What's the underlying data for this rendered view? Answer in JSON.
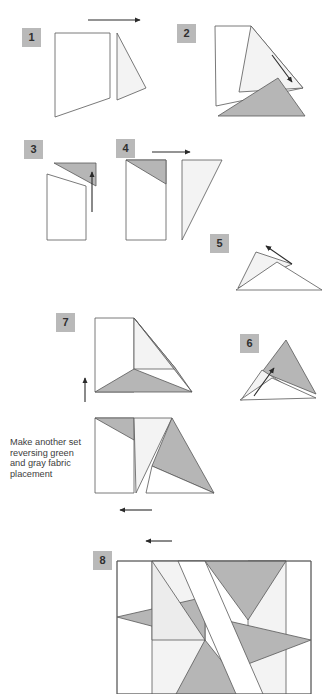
{
  "document": {
    "title": "Quilt Block Assembly Diagram",
    "type": "step-by-step sewing instruction illustration",
    "background_color": "#ffffff"
  },
  "palette": {
    "fabric_white": "#ffffff",
    "fabric_light": "#ececec",
    "fabric_light_alt": "#f3f3f3",
    "fabric_gray": "#b6b6b6",
    "fabric_gray_dark": "#aaaaaa",
    "outline": "#585858",
    "badge_fill": "#b9b9b9",
    "badge_text": "#2f2f2f",
    "arrow": "#2a2a2a",
    "note_text": "#3c3c3c"
  },
  "steps": [
    {
      "number": "1",
      "badge": {
        "x": 22,
        "y": 28,
        "w": 19,
        "h": 19
      },
      "arrow": {
        "name": "arrow-right-step1",
        "direction": "right",
        "x1": 88,
        "y1": 20,
        "x2": 140,
        "y2": 20
      }
    },
    {
      "number": "2",
      "badge": {
        "x": 177,
        "y": 24,
        "w": 19,
        "h": 19
      },
      "arrow": {
        "name": "arrow-down-right-step2",
        "direction": "down-right",
        "x1": 272,
        "y1": 55,
        "x2": 292,
        "y2": 82
      }
    },
    {
      "number": "3",
      "badge": {
        "x": 24,
        "y": 140,
        "w": 19,
        "h": 19
      },
      "arrow": {
        "name": "arrow-up-step3",
        "direction": "up",
        "x1": 92,
        "y1": 212,
        "x2": 92,
        "y2": 172
      }
    },
    {
      "number": "4",
      "badge": {
        "x": 116,
        "y": 139,
        "w": 19,
        "h": 19
      },
      "arrow": {
        "name": "arrow-right-step4",
        "direction": "right",
        "x1": 152,
        "y1": 152,
        "x2": 190,
        "y2": 152
      }
    },
    {
      "number": "5",
      "badge": {
        "x": 210,
        "y": 234,
        "w": 19,
        "h": 19
      },
      "arrow": {
        "name": "arrow-up-left-step5",
        "direction": "up-left",
        "x1": 292,
        "y1": 264,
        "x2": 266,
        "y2": 246
      }
    },
    {
      "number": "6",
      "badge": {
        "x": 240,
        "y": 334,
        "w": 19,
        "h": 19
      },
      "arrow": {
        "name": "arrow-up-left-step6",
        "direction": "up-left",
        "x1": 254,
        "y1": 396,
        "x2": 274,
        "y2": 368
      }
    },
    {
      "number": "7",
      "badge": {
        "x": 56,
        "y": 313,
        "w": 19,
        "h": 19
      },
      "arrow": {
        "name": "arrow-up-step7",
        "direction": "up",
        "x1": 85,
        "y1": 402,
        "x2": 85,
        "y2": 378
      }
    },
    {
      "number": "8",
      "badge": {
        "x": 93,
        "y": 551,
        "w": 19,
        "h": 19
      },
      "arrow": {
        "name": "arrow-left-step8",
        "direction": "left",
        "x1": 172,
        "y1": 541,
        "x2": 146,
        "y2": 541
      }
    }
  ],
  "extra_arrows": [
    {
      "name": "arrow-left-step7-lower",
      "direction": "left",
      "x1": 152,
      "y1": 510,
      "x2": 120,
      "y2": 510
    }
  ],
  "note": {
    "name": "fabric-placement-note",
    "lines": [
      "Make another set",
      "reversing green",
      "and gray fabric",
      "placement"
    ],
    "x": 10,
    "y": 445
  },
  "shapes": {
    "step1": [
      {
        "name": "piece-white-quad",
        "points": "55,33 110,33 110,98 55,117",
        "fill": "#ffffff"
      },
      {
        "name": "piece-light-triangle",
        "points": "117,33 117,100 146,88",
        "fill": "#f3f3f3"
      }
    ],
    "step2": [
      {
        "name": "piece-white-quad-rotated",
        "points": "215,26 251,26 303,88 216,106",
        "fill": "#ffffff"
      },
      {
        "name": "piece-light-sliver",
        "points": "251,26 303,88 239,92",
        "fill": "#f3f3f3"
      },
      {
        "name": "piece-gray-triangle",
        "points": "218,116 278,78 305,116",
        "fill": "#b6b6b6"
      }
    ],
    "step3": [
      {
        "name": "piece-gray-triangle",
        "points": "54,163 96,163 96,186",
        "fill": "#b6b6b6"
      },
      {
        "name": "piece-white-quad",
        "points": "47,174 86,186 86,240 47,240",
        "fill": "#ffffff"
      }
    ],
    "step4": [
      {
        "name": "piece-white-rect",
        "points": "126,160 166,160 166,240 126,240",
        "fill": "#ffffff"
      },
      {
        "name": "piece-gray-triangle",
        "points": "126,160 166,160 166,184",
        "fill": "#b6b6b6"
      },
      {
        "name": "piece-light-triangle",
        "points": "182,160 222,160 182,240",
        "fill": "#f3f3f3"
      }
    ],
    "step5": [
      {
        "name": "piece-light-triangle-upper",
        "points": "256,252 292,264 238,288",
        "fill": "#f3f3f3"
      },
      {
        "name": "piece-white-triangle-lower",
        "points": "277,262 322,290 236,290",
        "fill": "#ffffff"
      }
    ],
    "step6": [
      {
        "name": "piece-gray-triangle-large",
        "points": "286,340 316,394 262,372",
        "fill": "#b6b6b6"
      },
      {
        "name": "piece-light-triangle",
        "points": "262,370 290,388 241,400",
        "fill": "#f3f3f3"
      },
      {
        "name": "piece-white-triangle",
        "points": "272,378 316,398 240,400",
        "fill": "#ffffff"
      }
    ],
    "step7_upper": [
      {
        "name": "piece-white-rect",
        "points": "95,318 134,318 134,392 95,392",
        "fill": "#ffffff"
      },
      {
        "name": "piece-light-triangle",
        "points": "134,318 176,369 134,369",
        "fill": "#f3f3f3"
      },
      {
        "name": "piece-gray-triangle",
        "points": "134,369 192,392 95,392",
        "fill": "#b6b6b6"
      },
      {
        "name": "piece-gray-triangle-right",
        "points": "134,318 192,392 176,369",
        "fill": "#b6b6b6"
      }
    ],
    "step7_lower": [
      {
        "name": "piece-white-rect",
        "points": "95,418 134,418 134,493 95,493",
        "fill": "#ffffff"
      },
      {
        "name": "piece-gray-triangle-top",
        "points": "95,418 134,418 134,440",
        "fill": "#b6b6b6"
      },
      {
        "name": "piece-light-column",
        "points": "134,418 172,418 136,493",
        "fill": "#f3f3f3"
      },
      {
        "name": "piece-gray-triangle-right",
        "points": "172,418 214,493 152,466",
        "fill": "#b6b6b6"
      },
      {
        "name": "piece-white-triangle-right",
        "points": "152,466 214,493 146,493",
        "fill": "#ffffff"
      }
    ],
    "step8": [
      {
        "name": "block-background",
        "points": "117,561 311,561 311,694 117,694",
        "fill": "#ffffff"
      },
      {
        "name": "piece-light-center-column",
        "points": "152,561 205,561 205,694 152,694",
        "fill": "#f3f3f3"
      },
      {
        "name": "piece-light-right-column",
        "points": "248,561 286,561 286,694 248,694",
        "fill": "#f3f3f3"
      },
      {
        "name": "piece-gray-star-upper-right",
        "points": "205,561 286,561 248,620",
        "fill": "#b6b6b6"
      },
      {
        "name": "piece-gray-star-left",
        "points": "117,617 205,597 205,640",
        "fill": "#b6b6b6"
      },
      {
        "name": "piece-gray-star-right",
        "points": "311,640 224,620 248,664",
        "fill": "#b6b6b6"
      },
      {
        "name": "piece-light-star-upper-left",
        "points": "152,561 205,640 152,640",
        "fill": "#ececec"
      },
      {
        "name": "piece-gray-star-lower",
        "points": "205,640 248,694 176,694",
        "fill": "#b6b6b6"
      },
      {
        "name": "piece-white-diagonal-sash",
        "points": "178,561 205,561 263,694 236,694",
        "fill": "#ffffff"
      }
    ]
  }
}
